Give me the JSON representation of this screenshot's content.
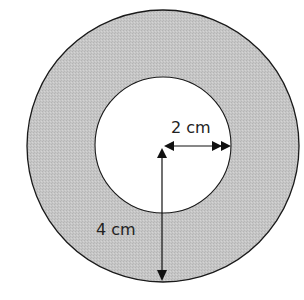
{
  "diagram": {
    "type": "annulus",
    "colors": {
      "ring_fill": "#c4c4c4",
      "inner_fill": "#ffffff",
      "stroke": "#1a1a1a",
      "background": "#ffffff"
    },
    "outer_circle": {
      "label": "4 cm",
      "radius_cm": 4
    },
    "inner_circle": {
      "label": "2 cm",
      "radius_cm": 2
    },
    "labels": {
      "inner_radius": "2 cm",
      "outer_radius": "4 cm"
    }
  }
}
